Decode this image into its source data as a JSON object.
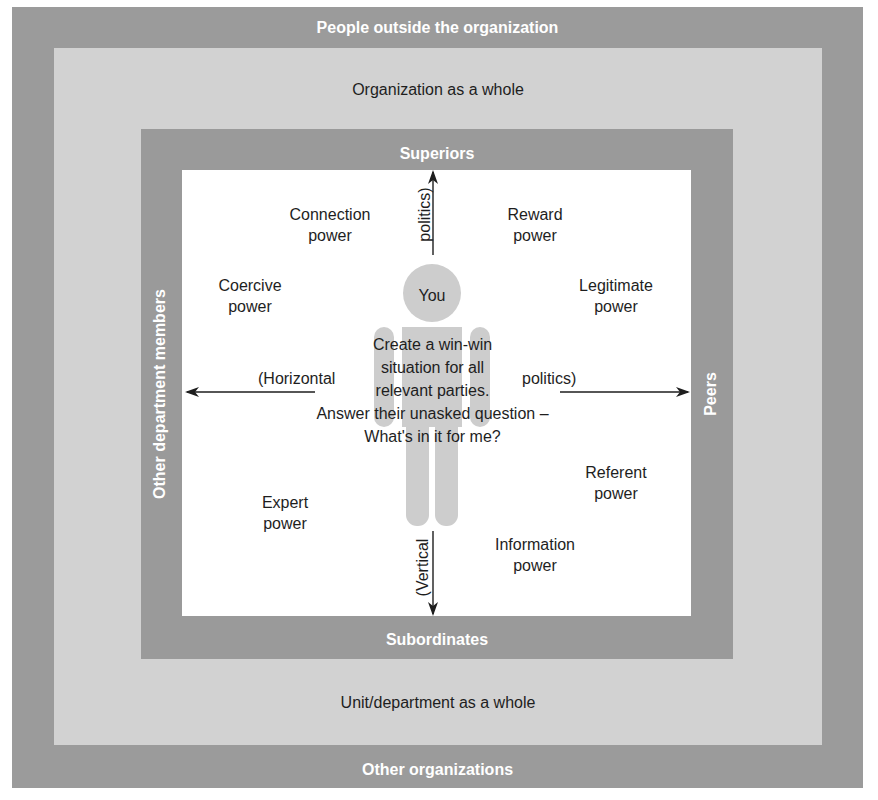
{
  "diagram": {
    "layers": {
      "outer_top": "People outside the organization",
      "outer_bottom": "Other organizations",
      "org_top": "Organization as a whole",
      "org_bottom": "Unit/department as a whole",
      "dept_top": "Superiors",
      "dept_bottom": "Subordinates",
      "dept_left": "Other department members",
      "dept_right": "Peers"
    },
    "center": {
      "figure_label": "You",
      "message_lines": [
        "Create a win-win",
        "situation for all",
        "relevant parties.",
        "Answer their unasked question –",
        "What's in it for me?"
      ]
    },
    "axes": {
      "horizontal_left": "(Horizontal",
      "horizontal_right": "politics)",
      "vertical_top": "politics)",
      "vertical_bottom": "(Vertical"
    },
    "powers": {
      "connection": [
        "Connection",
        "power"
      ],
      "reward": [
        "Reward",
        "power"
      ],
      "coercive": [
        "Coercive",
        "power"
      ],
      "legitimate": [
        "Legitimate",
        "power"
      ],
      "referent": [
        "Referent",
        "power"
      ],
      "expert": [
        "Expert",
        "power"
      ],
      "information": [
        "Information",
        "power"
      ]
    },
    "colors": {
      "outer": "#9b9b9b",
      "org": "#d2d2d2",
      "dept": "#9a9a9a",
      "inner": "#ffffff",
      "figure": "#cdcdcd",
      "text_dark": "#1e1e1e",
      "text_light": "#ffffff"
    }
  }
}
